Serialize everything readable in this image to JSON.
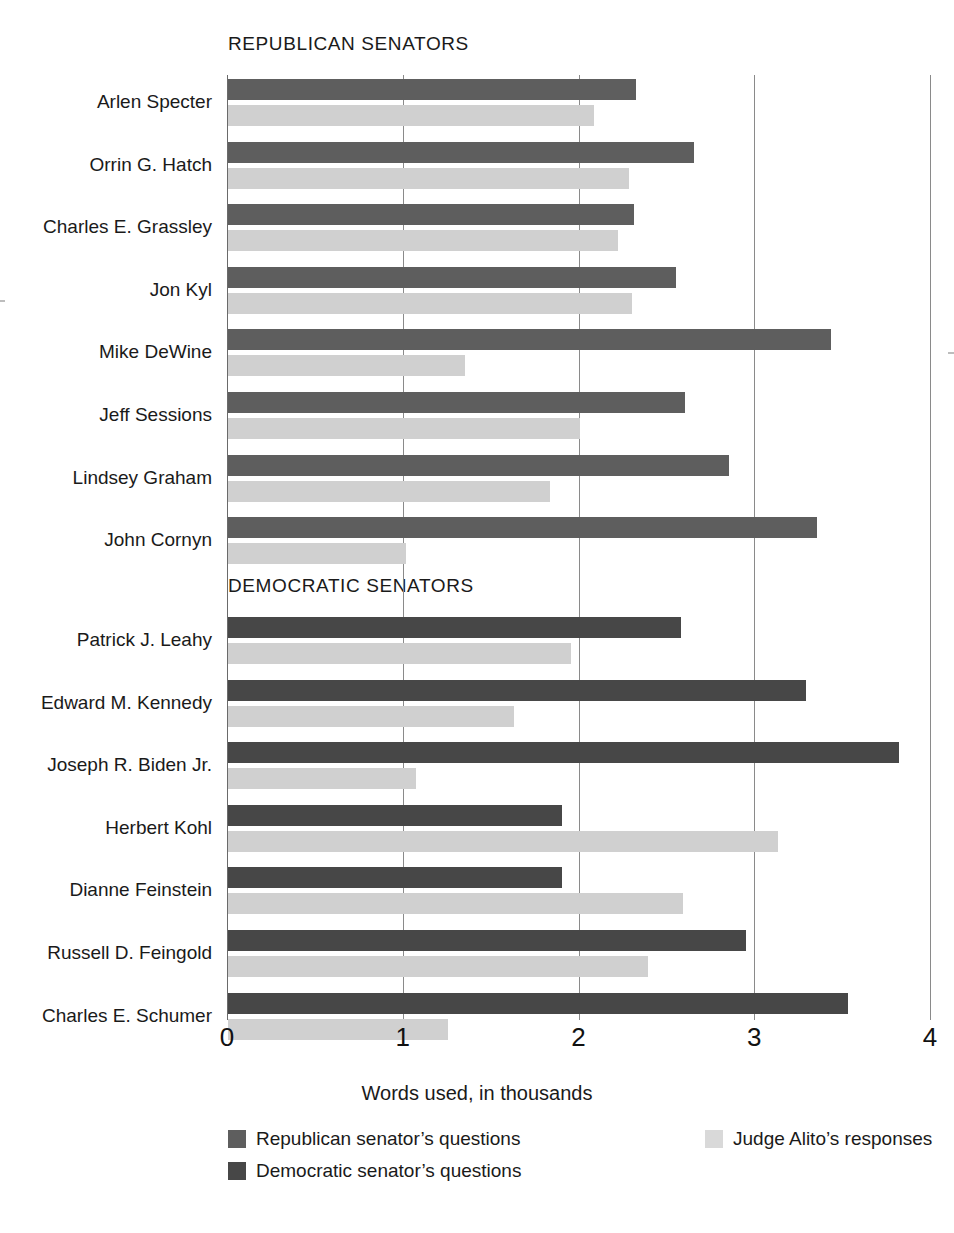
{
  "sections": {
    "republican_heading": "REPUBLICAN SENATORS",
    "democratic_heading": "DEMOCRATIC SENATORS"
  },
  "axis": {
    "title": "Words used, in thousands",
    "ticks": [
      "0",
      "1",
      "2",
      "3",
      "4"
    ],
    "min": 0,
    "max": 4
  },
  "legend": {
    "republican_questions": "Republican senator’s questions",
    "democratic_questions": "Democratic senator’s questions",
    "alito_responses": "Judge Alito’s responses"
  },
  "colors": {
    "republican": "#5e5e5e",
    "democratic": "#474747",
    "alito": "#d0d0d0",
    "gridline": "#8a8a8a",
    "text": "#1a1a1a"
  },
  "chart_data": {
    "type": "bar",
    "title": "",
    "subtitle": "",
    "xlabel": "Words used, in thousands",
    "ylabel": "",
    "xlim": [
      0,
      4
    ],
    "orientation": "horizontal",
    "grid": "vertical-gridlines-at-integers",
    "legend_position": "bottom",
    "xticks": [
      0,
      1,
      2,
      3,
      4
    ],
    "groups": [
      {
        "name": "REPUBLICAN SENATORS",
        "senator_series": "Republican senator’s questions",
        "categories": [
          "Arlen Specter",
          "Orrin G. Hatch",
          "Charles E. Grassley",
          "Jon Kyl",
          "Mike DeWine",
          "Jeff Sessions",
          "Lindsey Graham",
          "John Cornyn"
        ],
        "series": [
          {
            "name": "Republican senator’s questions",
            "values": [
              2.32,
              2.65,
              2.31,
              2.55,
              3.43,
              2.6,
              2.85,
              3.35
            ]
          },
          {
            "name": "Judge Alito’s responses",
            "values": [
              2.08,
              2.28,
              2.22,
              2.3,
              1.35,
              2.0,
              1.83,
              1.01
            ]
          }
        ]
      },
      {
        "name": "DEMOCRATIC SENATORS",
        "senator_series": "Democratic senator’s questions",
        "categories": [
          "Patrick J. Leahy",
          "Edward M. Kennedy",
          "Joseph R. Biden Jr.",
          "Herbert Kohl",
          "Dianne Feinstein",
          "Russell D. Feingold",
          "Charles E. Schumer"
        ],
        "series": [
          {
            "name": "Democratic senator’s questions",
            "values": [
              2.58,
              3.29,
              3.82,
              1.9,
              1.9,
              2.95,
              3.53
            ]
          },
          {
            "name": "Judge Alito’s responses",
            "values": [
              1.95,
              1.63,
              1.07,
              3.13,
              2.59,
              2.39,
              1.25
            ]
          }
        ]
      }
    ]
  }
}
